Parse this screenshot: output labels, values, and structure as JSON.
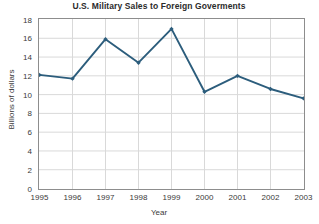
{
  "chart_data": {
    "type": "line",
    "title": "U.S. Military Sales to Foreign Goverments",
    "xlabel": "Year",
    "ylabel": "Billions of dollars",
    "categories": [
      "1995",
      "1996",
      "1997",
      "1998",
      "1999",
      "2000",
      "2001",
      "2002",
      "2003"
    ],
    "values": [
      12.1,
      11.7,
      15.9,
      13.4,
      17.0,
      10.3,
      12.0,
      10.6,
      9.6
    ],
    "x": [
      1995,
      1996,
      1997,
      1998,
      1999,
      2000,
      2001,
      2002,
      2003
    ],
    "xlim": [
      1995,
      2003
    ],
    "ylim": [
      0,
      18
    ],
    "ytick_labels": [
      "0",
      "2",
      "4",
      "6",
      "8",
      "10",
      "12",
      "14",
      "16",
      "18"
    ],
    "ytick_values": [
      0,
      2,
      4,
      6,
      8,
      10,
      12,
      14,
      16,
      18
    ],
    "xtick_labels": [
      "1995",
      "1996",
      "1997",
      "1998",
      "1999",
      "2000",
      "2001",
      "2002",
      "2003"
    ],
    "grid": true,
    "legend": false,
    "series_color": "#2c5d7c",
    "grid_color": "#d9d9d9",
    "frame_color": "#8d8d8d",
    "marker": "diamond"
  }
}
